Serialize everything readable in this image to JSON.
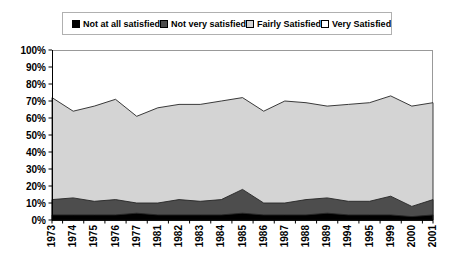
{
  "chart_data": {
    "type": "area",
    "subtype": "stacked-100-percent",
    "title": "",
    "categories": [
      "1973",
      "1974",
      "1975",
      "1976",
      "1977",
      "1981",
      "1982",
      "1983",
      "1984",
      "1985",
      "1986",
      "1987",
      "1988",
      "1989",
      "1994",
      "1995",
      "1999",
      "2000",
      "2001"
    ],
    "series": [
      {
        "name": "Not at all satisfied",
        "color": "#000000",
        "values": [
          3,
          3,
          3,
          3,
          4,
          3,
          3,
          3,
          3,
          4,
          3,
          3,
          3,
          4,
          3,
          3,
          3,
          2,
          3
        ]
      },
      {
        "name": "Not very satisfied",
        "color": "#4d4d4d",
        "values": [
          9,
          10,
          8,
          9,
          6,
          7,
          9,
          8,
          9,
          14,
          7,
          7,
          9,
          9,
          8,
          8,
          11,
          6,
          9
        ]
      },
      {
        "name": "Fairly Satisfied",
        "color": "#d4d4d4",
        "values": [
          60,
          51,
          56,
          59,
          51,
          56,
          56,
          57,
          58,
          54,
          54,
          60,
          57,
          54,
          57,
          58,
          59,
          59,
          57
        ]
      },
      {
        "name": "Very Satisfied",
        "color": "#ffffff",
        "values": [
          28,
          36,
          33,
          29,
          39,
          34,
          32,
          32,
          30,
          28,
          36,
          30,
          31,
          33,
          32,
          31,
          27,
          33,
          31
        ]
      }
    ],
    "ylim": [
      0,
      100
    ],
    "y_ticks": [
      "0%",
      "10%",
      "20%",
      "30%",
      "40%",
      "50%",
      "60%",
      "70%",
      "80%",
      "90%",
      "100%"
    ],
    "xlabel": "",
    "ylabel": "",
    "grid": false,
    "legend_position": "top",
    "colors": {
      "plot_border": "#999999",
      "axis": "#000000",
      "legend_border": "#b0b0b0",
      "boundary_line": "#262626"
    }
  }
}
